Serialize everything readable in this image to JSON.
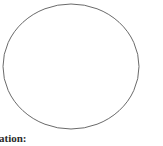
{
  "page": {
    "background_color": "#ffffff",
    "width": 163,
    "height": 146
  },
  "figure": {
    "name": "circle-outline",
    "shape": "circle",
    "stroke_color": "#6a6a6a",
    "fill_color": "#ffffff",
    "stroke_width": 1,
    "center_x": 71,
    "center_y": 66.5,
    "radius_x": 68,
    "radius_y": 62.5
  },
  "caption": {
    "text": "ation:",
    "color": "#2b2b2b",
    "clipped_left": true
  }
}
